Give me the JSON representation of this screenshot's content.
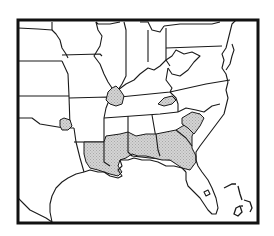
{
  "map": {
    "type": "range-distribution-map",
    "region": "Southeastern and Central United States",
    "legend": [],
    "colors": {
      "frame": "#111111",
      "border": "#1a1a1a",
      "land": "#ffffff",
      "range_fill": "#d4d4d4",
      "range_dot": "#a8a8a8"
    },
    "frame_box": {
      "x": 18,
      "y": 20,
      "width": 240,
      "height": 203
    },
    "shaded_regions": [
      {
        "id": "gulf-coastal-plain",
        "description": "southern Louisiana, Mississippi, Alabama, Georgia, South Carolina and Florida panhandle"
      },
      {
        "id": "southern-illinois-kentucky",
        "description": "southern Illinois / western Kentucky"
      },
      {
        "id": "east-tennessee",
        "description": "eastern Tennessee"
      },
      {
        "id": "se-oklahoma",
        "description": "southeastern Oklahoma"
      }
    ],
    "labels": []
  }
}
